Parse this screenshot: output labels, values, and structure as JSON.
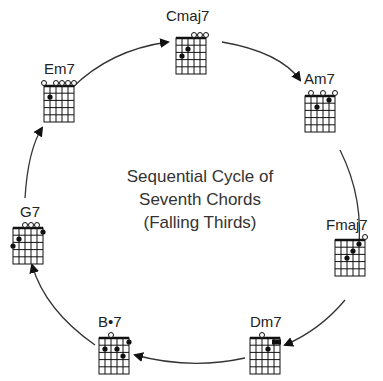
{
  "title": {
    "line1": "Sequential Cycle of",
    "line2": "Seventh Chords",
    "line3": "(Falling Thirds)"
  },
  "colors": {
    "line": "#333333",
    "text": "#222222",
    "dot": "#111111"
  },
  "chords": [
    {
      "name": "Cmaj7",
      "label": "Cmaj7",
      "position": "top"
    },
    {
      "name": "Am7",
      "label": "Am7",
      "position": "upper-right"
    },
    {
      "name": "Fmaj7",
      "label": "Fmaj7",
      "position": "right"
    },
    {
      "name": "Dm7",
      "label": "Dm7",
      "position": "lower-right"
    },
    {
      "name": "B-half-diminished-7",
      "label": "B•7",
      "position": "lower-left"
    },
    {
      "name": "G7",
      "label": "G7",
      "position": "left"
    },
    {
      "name": "Em7",
      "label": "Em7",
      "position": "upper-left"
    }
  ],
  "cycle_order": [
    "Cmaj7",
    "Am7",
    "Fmaj7",
    "Dm7",
    "B•7",
    "G7",
    "Em7"
  ]
}
